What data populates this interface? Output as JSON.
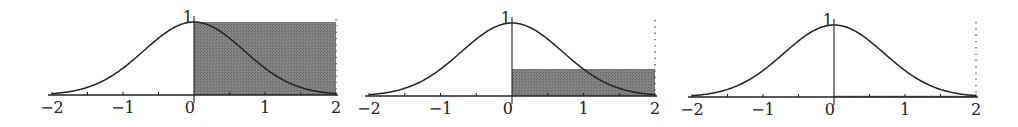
{
  "chart_data": [
    {
      "type": "area",
      "title": "",
      "function": "exp(-x^2)",
      "xlim": [
        -2,
        2
      ],
      "ylim": [
        0,
        1
      ],
      "x_tick_labels": [
        "-2",
        "-1",
        "0",
        "1",
        "2"
      ],
      "y_tick_labels": [
        "1"
      ],
      "minor_ticks_x": [
        -1.5,
        -0.5,
        0.5,
        1.5
      ],
      "rectangle": {
        "x_from": 0,
        "x_to": 2,
        "height": 1.0
      },
      "dotted_line_x": 2,
      "grid": false
    },
    {
      "type": "area",
      "title": "",
      "function": "exp(-x^2)",
      "xlim": [
        -2,
        2
      ],
      "ylim": [
        0,
        1
      ],
      "x_tick_labels": [
        "-2",
        "-1",
        "0",
        "1",
        "2"
      ],
      "y_tick_labels": [
        "1"
      ],
      "minor_ticks_x": [
        -1.5,
        -0.5,
        0.5,
        1.5
      ],
      "rectangle": {
        "x_from": 0,
        "x_to": 2,
        "height": 0.37
      },
      "dotted_line_x": 2,
      "grid": false
    },
    {
      "type": "area",
      "title": "",
      "function": "exp(-x^2)",
      "xlim": [
        -2,
        2
      ],
      "ylim": [
        0,
        1
      ],
      "x_tick_labels": [
        "-2",
        "-1",
        "0",
        "1",
        "2"
      ],
      "y_tick_labels": [
        "1"
      ],
      "minor_ticks_x": [
        -1.5,
        -0.5,
        0.5,
        1.5
      ],
      "rectangle": {
        "x_from": 0,
        "x_to": 2,
        "height": 0.018
      },
      "dotted_line_x": 2,
      "grid": false
    }
  ],
  "panels": [
    {
      "x0": 194,
      "unit": 71,
      "axis_y": 95,
      "peak_y": 22
    },
    {
      "x0": 512,
      "unit": 71.5,
      "axis_y": 96,
      "peak_y": 23
    },
    {
      "x0": 834,
      "unit": 71,
      "axis_y": 97,
      "peak_y": 25
    }
  ],
  "colors": {
    "curve": "#222222",
    "shade": "#7a7a7a",
    "axis": "#222222"
  }
}
